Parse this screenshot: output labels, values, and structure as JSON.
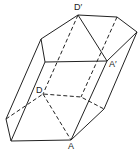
{
  "diagram": {
    "type": "hexagonal prism (oblique)",
    "labels": {
      "d_prime": "D′",
      "a_prime": "A′",
      "d": "D",
      "a": "A"
    },
    "colors": {
      "line": "#222222",
      "background": "#ffffff"
    }
  }
}
